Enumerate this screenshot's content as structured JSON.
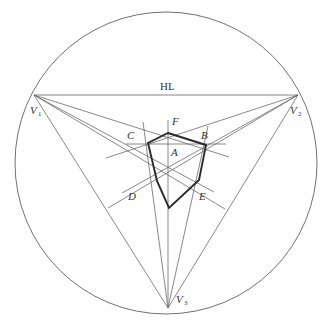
{
  "diagram": {
    "type": "three-point perspective construction",
    "horizon_label": "HL",
    "vanishing_points": [
      {
        "id": "V1",
        "label": "V",
        "sub": "1",
        "x": 34,
        "y": 95
      },
      {
        "id": "V2",
        "label": "V",
        "sub": "2",
        "x": 298,
        "y": 95
      },
      {
        "id": "V3",
        "label": "V",
        "sub": "3",
        "x": 168,
        "y": 308
      }
    ],
    "points": {
      "A": {
        "label": "A",
        "x": 169,
        "y": 165
      },
      "B": {
        "label": "B",
        "x": 206,
        "y": 145
      },
      "C": {
        "label": "C",
        "x": 148,
        "y": 143
      },
      "D": {
        "label": "D",
        "x": 157,
        "y": 181
      },
      "E": {
        "label": "E",
        "x": 199,
        "y": 180
      },
      "F": {
        "label": "F",
        "x": 168,
        "y": 133
      },
      "G": {
        "label": "",
        "x": 169,
        "y": 208
      }
    },
    "circle": {
      "cx": 166,
      "cy": 163,
      "r": 151
    },
    "colors": {
      "thin_line": "#6a6a6a",
      "bold_line": "#2a2a2a",
      "background": "#ffffff"
    }
  }
}
